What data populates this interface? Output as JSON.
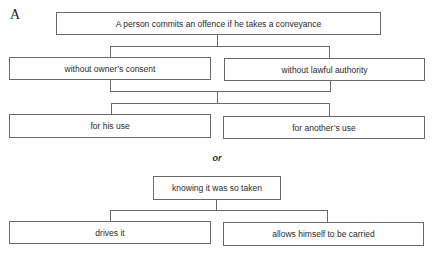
{
  "figure": {
    "label": "A",
    "root": "A person commits an offence if he takes a conveyance",
    "level1": [
      "without owner’s consent",
      "without lawful authority"
    ],
    "level2": [
      "for his use",
      "for another’s use"
    ],
    "connector": "or",
    "secondary_root": "knowing it was so taken",
    "secondary_children": [
      "drives it",
      "allows himself to be carried"
    ],
    "footer": "illegible caption"
  },
  "colors": {
    "line": "#6a6a6a",
    "text": "#2a2a2a",
    "background": "#ffffff"
  }
}
